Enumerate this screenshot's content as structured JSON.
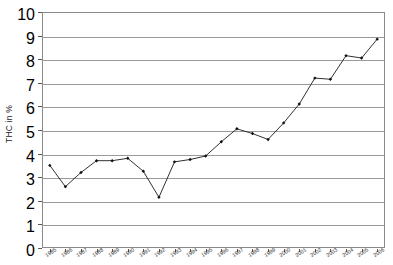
{
  "chart_data": {
    "type": "line",
    "title": "",
    "subtitle": "",
    "xlabel": "",
    "ylabel": "THC in %",
    "ylim": [
      0,
      10
    ],
    "ytick_step": 1,
    "grid": true,
    "legend": "none",
    "marker": "filled-diamond",
    "line_color": "#1a1a1a",
    "grid_color": "#9a9a9a",
    "frame_color": "#8a8a8a",
    "background": "#ffffff",
    "categories": [
      "1985",
      "1986",
      "1987",
      "1988",
      "1989",
      "1990",
      "1991",
      "1992",
      "1993",
      "1994",
      "1995",
      "1996",
      "1997",
      "1998",
      "1999",
      "2000",
      "2001",
      "2002",
      "2003",
      "2004",
      "2005",
      "2006"
    ],
    "values": [
      3.5,
      2.6,
      3.2,
      3.7,
      3.7,
      3.8,
      3.25,
      2.15,
      3.65,
      3.75,
      3.9,
      4.5,
      5.05,
      4.85,
      4.6,
      5.3,
      6.1,
      7.2,
      7.15,
      8.15,
      8.05,
      8.85
    ],
    "ytick_labels": [
      "0",
      "1",
      "2",
      "3",
      "4",
      "5",
      "6",
      "7",
      "8",
      "9",
      "10"
    ],
    "series": [
      {
        "name": "THC in %",
        "values": [
          3.5,
          2.6,
          3.2,
          3.7,
          3.7,
          3.8,
          3.25,
          2.15,
          3.65,
          3.75,
          3.9,
          4.5,
          5.05,
          4.85,
          4.6,
          5.3,
          6.1,
          7.2,
          7.15,
          8.15,
          8.05,
          8.85
        ]
      }
    ]
  }
}
